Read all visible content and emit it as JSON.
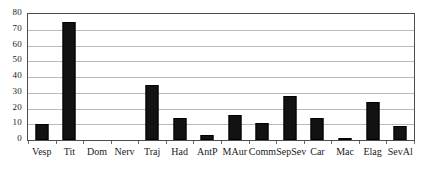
{
  "chart_data": {
    "type": "bar",
    "title": "",
    "subtitle": "",
    "xlabel": "",
    "ylabel": "",
    "categories": [
      "Vesp",
      "Tit",
      "Dom",
      "Nerv",
      "Traj",
      "Had",
      "AntP",
      "MAur",
      "Comm",
      "SepSev",
      "Car",
      "Mac",
      "Elag",
      "SevAl"
    ],
    "values": [
      10,
      75,
      0,
      0,
      35,
      14,
      3,
      16,
      11,
      28,
      14,
      1,
      24,
      9
    ],
    "ylim": [
      0,
      80
    ],
    "yticks": [
      0,
      10,
      20,
      30,
      40,
      50,
      60,
      70,
      80
    ],
    "ytick_labels": [
      "0",
      "10",
      "20",
      "30",
      "40",
      "50",
      "60",
      "70",
      "80"
    ],
    "grid": true,
    "grid_axis": "y",
    "legend": false,
    "legend_position": "none",
    "bar_color": "#121212",
    "grid_color": "#b9b9b9",
    "frame_color": "#4d4d4d"
  }
}
